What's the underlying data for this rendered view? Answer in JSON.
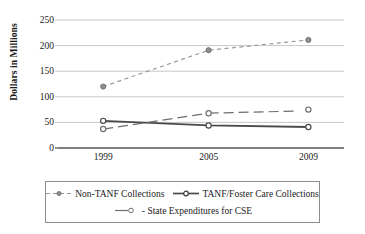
{
  "chart_data": {
    "type": "line",
    "title": "",
    "xlabel": "",
    "ylabel": "Dollars in Millions",
    "categories": [
      "1999",
      "2005",
      "2009"
    ],
    "ylim": [
      0,
      250
    ],
    "yticks": [
      0,
      50,
      100,
      150,
      200,
      250
    ],
    "ytick_labels": [
      "0",
      "50",
      "100",
      "150",
      "200",
      "250"
    ],
    "grid": "horizontal",
    "legend_position": "bottom",
    "series": [
      {
        "name": "Non-TANF Collections",
        "values": [
          120,
          191,
          211
        ],
        "line_style": "dashed",
        "marker": "filled-circle",
        "color": "#9a9a9a"
      },
      {
        "name": "TANF/Foster Care Collections",
        "values": [
          53,
          44,
          41
        ],
        "line_style": "solid",
        "marker": "open-circle",
        "color": "#4a4a4a"
      },
      {
        "name": "State Expenditures for CSE",
        "values": [
          37,
          68,
          75
        ],
        "line_style": "long-dash",
        "marker": "open-circle",
        "color": "#6e6e6e"
      }
    ]
  },
  "legend": {
    "items": [
      {
        "label": "Non-TANF Collections",
        "swatch": "dashed-dot-marker-icon"
      },
      {
        "label": "TANF/Foster Care Collections",
        "swatch": "solid-circle-marker-icon"
      },
      {
        "label": "- State Expenditures for CSE",
        "swatch": "line-open-circle-marker-icon"
      }
    ]
  }
}
